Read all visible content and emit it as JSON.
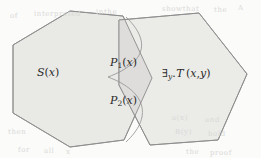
{
  "figure": {
    "type": "venn-hexagon-diagram",
    "width": 261,
    "height": 158,
    "background_color": "#fbfbfa",
    "shape_fill": "#e9e9e6",
    "shape_fill_overlap": "#dedddb",
    "stroke_color": "#8c8c8c",
    "arc_stroke_color": "#9a9a9a",
    "label_color": "#2b2b2b"
  },
  "regions": [
    {
      "id": "left-hexagon",
      "name": "S-region",
      "label": "S(x)",
      "label_parts": {
        "head": "S",
        "open": "(",
        "arg": "x",
        "close": ")"
      }
    },
    {
      "id": "overlap-upper",
      "name": "P1-region",
      "label": "P₁(x)",
      "label_parts": {
        "head": "P",
        "sub": "1",
        "open": "(",
        "arg": "x",
        "close": ")"
      }
    },
    {
      "id": "overlap-lower",
      "name": "P2-region",
      "label": "P₂(x)",
      "label_parts": {
        "head": "P",
        "sub": "2",
        "open": "(",
        "arg": "x",
        "close": ")"
      }
    },
    {
      "id": "right-hexagon",
      "name": "T-region",
      "label": "∃y.T (x,y)",
      "label_parts": {
        "quant": "∃",
        "bound": "y",
        "dot": ".",
        "pred": "T",
        "open": "(",
        "arg1": "x",
        "comma": ",",
        "arg2": "y",
        "close": ")"
      }
    }
  ],
  "background_artifacts": [
    {
      "text": "showthat",
      "x": 162,
      "y": 5
    },
    {
      "text": "the",
      "x": 214,
      "y": 6
    },
    {
      "text": "A",
      "x": 238,
      "y": 4
    },
    {
      "text": "of",
      "x": 10,
      "y": 12
    },
    {
      "text": "interpreted",
      "x": 34,
      "y": 10
    },
    {
      "text": "inthe",
      "x": 96,
      "y": 8
    },
    {
      "text": "then",
      "x": 8,
      "y": 128
    },
    {
      "text": "a(x)",
      "x": 172,
      "y": 114
    },
    {
      "text": "and",
      "x": 205,
      "y": 116
    },
    {
      "text": "B(y)",
      "x": 175,
      "y": 128
    },
    {
      "text": "hold",
      "x": 208,
      "y": 130
    },
    {
      "text": "for",
      "x": 18,
      "y": 146
    },
    {
      "text": "all",
      "x": 44,
      "y": 147
    },
    {
      "text": "x",
      "x": 66,
      "y": 148
    },
    {
      "text": "the",
      "x": 186,
      "y": 148
    },
    {
      "text": "proof",
      "x": 210,
      "y": 149
    }
  ]
}
